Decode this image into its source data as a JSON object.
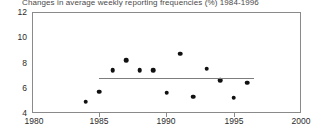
{
  "chart_data": {
    "type": "scatter",
    "title": "Changes in average weekly reporting frequencies (%) 1984-1996",
    "xlabel": "",
    "ylabel": "",
    "xlim": [
      1980,
      2000
    ],
    "ylim": [
      4,
      12
    ],
    "xticks": [
      1980,
      1985,
      1990,
      1995,
      2000
    ],
    "yticks": [
      4,
      6,
      8,
      10,
      12
    ],
    "grid": false,
    "legend": null,
    "x": [
      1984,
      1985,
      1986,
      1987,
      1988,
      1989,
      1990,
      1991,
      1992,
      1993,
      1994,
      1995,
      1996
    ],
    "y": [
      4.9,
      5.7,
      7.4,
      8.2,
      7.4,
      7.4,
      5.6,
      8.7,
      5.3,
      7.5,
      6.6,
      5.2,
      6.4
    ],
    "series": [
      {
        "name": "Average weekly reporting frequency",
        "values": [
          4.9,
          5.7,
          7.4,
          8.2,
          7.4,
          7.4,
          5.6,
          8.7,
          5.3,
          7.5,
          6.6,
          5.2,
          6.4
        ]
      }
    ],
    "annotations": [
      {
        "type": "trend-line",
        "orientation": "horizontal",
        "value": 6.8,
        "x_start": 1985,
        "x_end": 1996.5
      }
    ]
  },
  "axes": {
    "y_tick_labels": [
      "12",
      "10",
      "8",
      "6",
      "4"
    ],
    "x_tick_labels": [
      "1980",
      "1985",
      "1990",
      "1995",
      "2000"
    ]
  }
}
